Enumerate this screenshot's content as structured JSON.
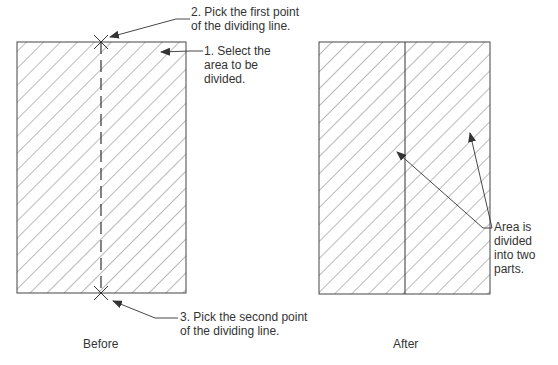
{
  "before": {
    "caption": "Before",
    "step1_line1": "1. Select the",
    "step1_line2": "area to be",
    "step1_line3": "divided.",
    "step2_line1": "2. Pick the first point",
    "step2_line2": "of the dividing line.",
    "step3_line1": "3. Pick the second point",
    "step3_line2": "of the dividing line."
  },
  "after": {
    "caption": "After",
    "note_line1": "Area is",
    "note_line2": "divided",
    "note_line3": "into two",
    "note_line4": "parts."
  },
  "colors": {
    "line": "#444444",
    "hatch": "#555555",
    "text": "#333333"
  }
}
